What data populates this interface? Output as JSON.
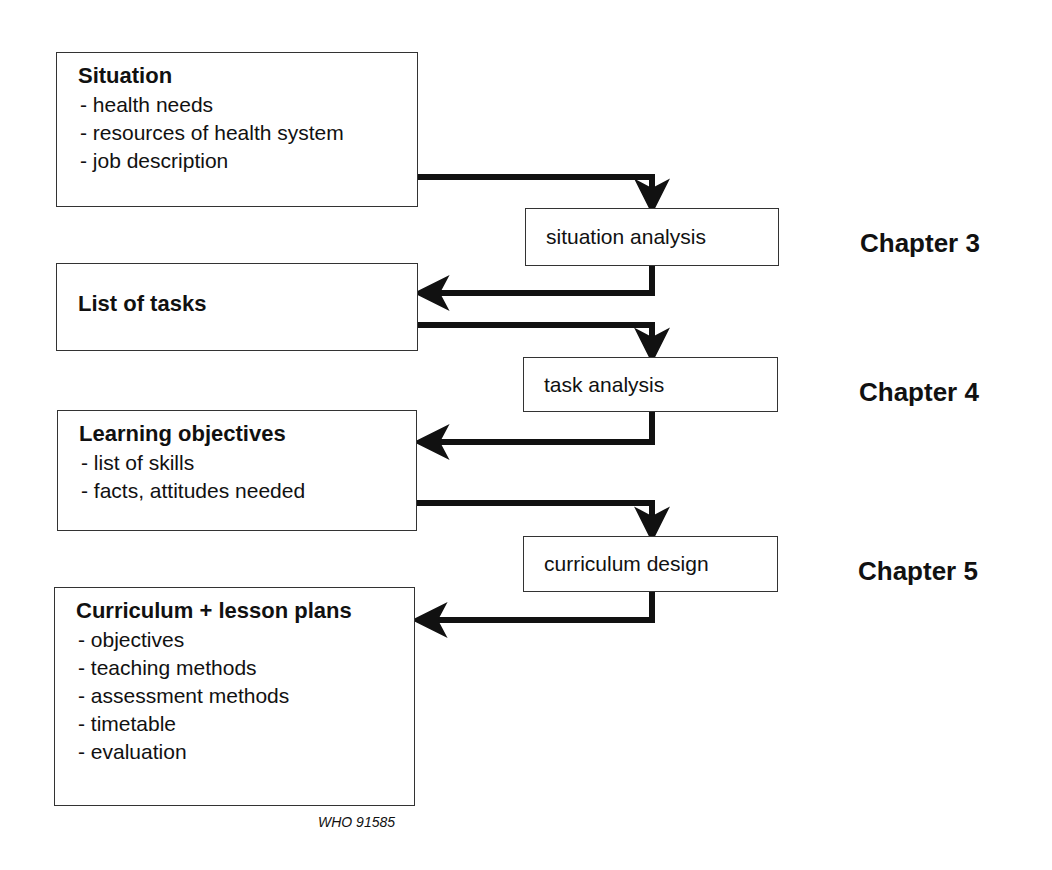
{
  "diagram": {
    "outputs": [
      {
        "title": "Situation",
        "items": [
          "- health needs",
          "- resources of health system",
          "- job description"
        ]
      },
      {
        "title": "List of tasks",
        "items": []
      },
      {
        "title": "Learning objectives",
        "items": [
          "- list of skills",
          "- facts, attitudes needed"
        ]
      },
      {
        "title": "Curriculum + lesson plans",
        "items": [
          "- objectives",
          "- teaching methods",
          "- assessment methods",
          "- timetable",
          "- evaluation"
        ]
      }
    ],
    "processes": [
      {
        "label": "situation analysis",
        "chapter": "Chapter 3"
      },
      {
        "label": "task analysis",
        "chapter": "Chapter 4"
      },
      {
        "label": "curriculum design",
        "chapter": "Chapter 5"
      }
    ],
    "arrow_color": "#111111",
    "border_color": "#333333",
    "figure_code": "WHO 91585"
  }
}
